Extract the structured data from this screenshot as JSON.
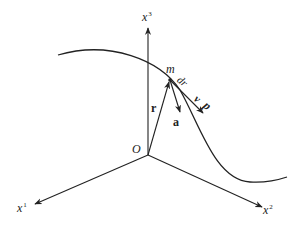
{
  "diagram": {
    "title": "",
    "colors": {
      "stroke": "#222222",
      "background": "#ffffff"
    },
    "origin": {
      "label": "O",
      "x": 148,
      "y": 155
    },
    "axes": [
      {
        "id": "x3",
        "base": "x",
        "sup": "3",
        "end": [
          148,
          28
        ]
      },
      {
        "id": "x1",
        "base": "x",
        "sup": "1",
        "end": [
          35,
          204
        ]
      },
      {
        "id": "x2",
        "base": "x",
        "sup": "2",
        "end": [
          262,
          207
        ]
      }
    ],
    "point": {
      "label": "m",
      "x": 170,
      "y": 80
    },
    "curve": {
      "path": "M58,55 C110,40 160,60 180,90 C200,125 215,180 250,182 C265,183 278,180 287,177"
    },
    "vectors": [
      {
        "id": "r",
        "label": "r",
        "from": [
          148,
          155
        ],
        "to": [
          170,
          80
        ]
      },
      {
        "id": "a",
        "label": "a",
        "from": [
          170,
          80
        ],
        "to": [
          180,
          112
        ]
      },
      {
        "id": "dr",
        "label": "dr",
        "from": [
          170,
          80
        ],
        "to": [
          203,
          113
        ]
      }
    ],
    "labels": {
      "x3": "x",
      "x3_sup": "3",
      "x1": "x",
      "x1_sup": "1",
      "x2": "x",
      "x2_sup": "2",
      "origin": "O",
      "point": "m",
      "r": "r",
      "a": "a",
      "dr": "dr",
      "v": "v",
      "p": "p"
    }
  }
}
